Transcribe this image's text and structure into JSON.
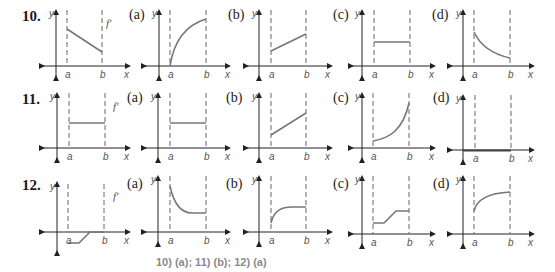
{
  "problems": [
    {
      "number": "10.",
      "given_label": "f'",
      "given_graph": "decreasing line segment from a to b",
      "options": [
        {
          "label": "(a)",
          "graph": "concave-down increasing curve starting at zero at a"
        },
        {
          "label": "(b)",
          "graph": "increasing line segment from a to b"
        },
        {
          "label": "(c)",
          "graph": "horizontal line segment from a to b"
        },
        {
          "label": "(d)",
          "graph": "decreasing concave-up curve from a to b"
        }
      ]
    },
    {
      "number": "11.",
      "given_label": "f'",
      "given_graph": "horizontal line segment from a to b",
      "options": [
        {
          "label": "(a)",
          "graph": "horizontal line segment from a to b"
        },
        {
          "label": "(b)",
          "graph": "increasing line segment from a to b"
        },
        {
          "label": "(c)",
          "graph": "increasing concave-up curve from a to b"
        },
        {
          "label": "(d)",
          "graph": "zero line along x-axis from a to b"
        }
      ]
    },
    {
      "number": "12.",
      "given_label": "f'",
      "given_graph": "negative constant, then ramp up to zero, then zero",
      "options": [
        {
          "label": "(a)",
          "graph": "decreasing concave-up curve leveling off"
        },
        {
          "label": "(b)",
          "graph": "increasing concave-down curve leveling off"
        },
        {
          "label": "(c)",
          "graph": "flat, ramp up, flat step"
        },
        {
          "label": "(d)",
          "graph": "increasing concave-down curve"
        }
      ]
    }
  ],
  "axis_labels": {
    "x": "x",
    "y": "y",
    "a": "a",
    "b": "b"
  },
  "answer_key": "10) (a); 11) (b); 12) (a)"
}
